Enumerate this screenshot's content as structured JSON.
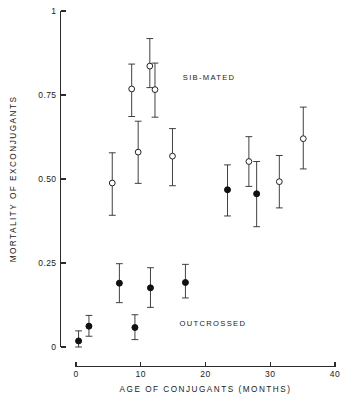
{
  "chart_data": {
    "type": "scatter",
    "title": "",
    "xlabel": "AGE OF CONJUGANTS (MONTHS)",
    "ylabel": "MORTALITY OF EXCONJUGANTS",
    "xlim": [
      0,
      40
    ],
    "ylim": [
      0,
      1
    ],
    "grid": false,
    "legend_position": "inline-annotation",
    "xticks": [
      0,
      10,
      20,
      30,
      40
    ],
    "xtick_labels": [
      "0",
      "10",
      "20",
      "30",
      "40"
    ],
    "yticks": [
      0,
      0.25,
      0.5,
      0.75,
      1
    ],
    "ytick_labels": [
      "0",
      "0.25",
      "0.50",
      "0.75",
      "1"
    ],
    "annotations": [
      {
        "text": "SIB-MATED",
        "x": 16.5,
        "y": 0.805
      },
      {
        "text": "OUTCROSSED",
        "x": 16.0,
        "y": 0.072
      }
    ],
    "series": [
      {
        "name": "SIB-MATED",
        "marker": "open-circle",
        "points": [
          {
            "x": 5.6,
            "y": 0.488,
            "err_low": 0.392,
            "err_high": 0.578
          },
          {
            "x": 8.6,
            "y": 0.768,
            "err_low": 0.686,
            "err_high": 0.842
          },
          {
            "x": 9.6,
            "y": 0.58,
            "err_low": 0.487,
            "err_high": 0.672
          },
          {
            "x": 11.4,
            "y": 0.836,
            "err_low": 0.772,
            "err_high": 0.918
          },
          {
            "x": 12.2,
            "y": 0.766,
            "err_low": 0.684,
            "err_high": 0.845
          },
          {
            "x": 14.9,
            "y": 0.568,
            "err_low": 0.48,
            "err_high": 0.65
          },
          {
            "x": 26.7,
            "y": 0.552,
            "err_low": 0.478,
            "err_high": 0.626
          },
          {
            "x": 31.4,
            "y": 0.492,
            "err_low": 0.414,
            "err_high": 0.57
          },
          {
            "x": 35.1,
            "y": 0.62,
            "err_low": 0.53,
            "err_high": 0.714
          }
        ]
      },
      {
        "name": "OUTCROSSED",
        "marker": "filled-circle",
        "points": [
          {
            "x": 0.4,
            "y": 0.018,
            "err_low": 0.0,
            "err_high": 0.048
          },
          {
            "x": 2.0,
            "y": 0.062,
            "err_low": 0.032,
            "err_high": 0.094
          },
          {
            "x": 6.7,
            "y": 0.19,
            "err_low": 0.132,
            "err_high": 0.248
          },
          {
            "x": 9.1,
            "y": 0.058,
            "err_low": 0.022,
            "err_high": 0.096
          },
          {
            "x": 11.5,
            "y": 0.176,
            "err_low": 0.118,
            "err_high": 0.236
          },
          {
            "x": 16.9,
            "y": 0.192,
            "err_low": 0.146,
            "err_high": 0.246
          },
          {
            "x": 23.4,
            "y": 0.468,
            "err_low": 0.39,
            "err_high": 0.542
          },
          {
            "x": 27.9,
            "y": 0.456,
            "err_low": 0.358,
            "err_high": 0.552
          }
        ]
      }
    ]
  }
}
